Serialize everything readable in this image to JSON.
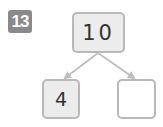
{
  "problem": {
    "number": "13"
  },
  "number_bond": {
    "whole": "10",
    "parts": [
      "4",
      ""
    ]
  },
  "colors": {
    "badge": "#8a8a8a",
    "box_border": "#b9b9b9",
    "filled_box": "#ececec",
    "empty_box": "#ffffff",
    "arrow": "#bdbdbd"
  }
}
